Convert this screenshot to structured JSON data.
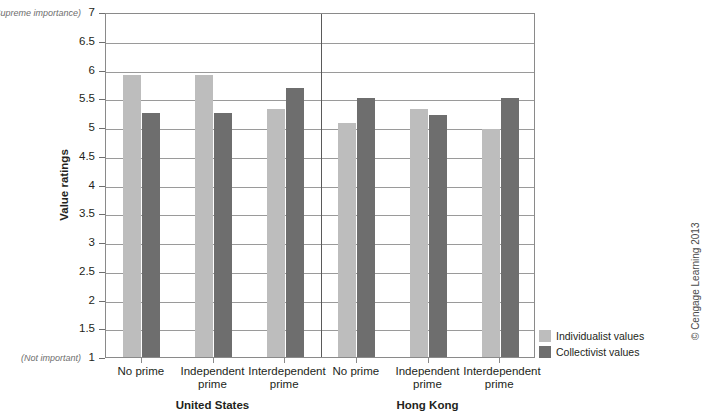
{
  "credit": "© Cengage Learning 2013",
  "axis": {
    "ylabel": "Value ratings",
    "top_note": "(Supreme importance)",
    "bottom_note": "(Not important)"
  },
  "legend": {
    "items": [
      {
        "label": "Individualist values",
        "color": "#bdbdbd",
        "key": "individualist"
      },
      {
        "label": "Collectivist values",
        "color": "#6e6e6e",
        "key": "collectivist"
      }
    ]
  },
  "chart_data": {
    "type": "bar",
    "title": "",
    "xlabel": "",
    "ylabel": "Value ratings",
    "ylim": [
      1,
      7
    ],
    "ytick_labels": [
      "7",
      "6.5",
      "6",
      "5.5",
      "5",
      "4.5",
      "4",
      "3.5",
      "3",
      "2.5",
      "2",
      "1.5",
      "1"
    ],
    "ytick_values": [
      7,
      6.5,
      6,
      5.5,
      5,
      4.5,
      4,
      3.5,
      3,
      2.5,
      2,
      1.5,
      1
    ],
    "grid": true,
    "legend_position": "bottom-right",
    "y_axis_anchors": {
      "top": "(Supreme importance)",
      "bottom": "(Not important)"
    },
    "groups": [
      {
        "name": "United States",
        "categories": [
          "No prime",
          "Independent\nprime",
          "Interdependent\nprime"
        ],
        "series": [
          {
            "name": "Individualist values",
            "values": [
              5.9,
              5.9,
              5.31
            ]
          },
          {
            "name": "Collectivist values",
            "values": [
              5.25,
              5.25,
              5.68
            ]
          }
        ]
      },
      {
        "name": "Hong Kong",
        "categories": [
          "No prime",
          "Independent\nprime",
          "Interdependent\nprime"
        ],
        "series": [
          {
            "name": "Individualist values",
            "values": [
              5.07,
              5.32,
              4.97
            ]
          },
          {
            "name": "Collectivist values",
            "values": [
              5.51,
              5.21,
              5.51
            ]
          }
        ]
      }
    ]
  }
}
